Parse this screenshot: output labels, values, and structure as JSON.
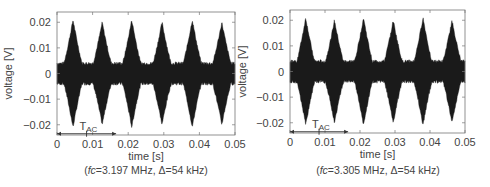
{
  "chart_data": [
    {
      "type": "line",
      "description": "Amplitude-modulated signal envelope (filled waveform)",
      "xlabel": "time [s]",
      "ylabel": "voltage [V]",
      "xlim": [
        0,
        0.05
      ],
      "ylim": [
        -0.024,
        0.024
      ],
      "xticks": [
        "0",
        "0.01",
        "0.02",
        "0.03",
        "0.04",
        "0.05"
      ],
      "yticks": [
        "0.02",
        "0.01",
        "0",
        "-0.01",
        "-0.02"
      ],
      "xtick_values": [
        0,
        0.01,
        0.02,
        0.03,
        0.04,
        0.05
      ],
      "ytick_values": [
        0.02,
        0.01,
        0,
        -0.01,
        -0.02
      ],
      "envelope": {
        "baseline_amplitude": 0.004,
        "peak_times": [
          0.0045,
          0.0127,
          0.021,
          0.0295,
          0.038,
          0.0463
        ],
        "peak_upper": [
          0.021,
          0.02,
          0.021,
          0.02,
          0.021,
          0.02
        ],
        "peak_lower": [
          -0.021,
          -0.02,
          -0.021,
          -0.02,
          -0.021,
          -0.02
        ]
      },
      "annotation": {
        "label": "T",
        "subscript": "AC",
        "arrow_from": 0,
        "arrow_mid": 0.0083,
        "arrow_to": 0.0166
      },
      "caption": {
        "prefix": "(",
        "italic": "fc",
        "rest": "=3.197 MHz, Δ=54 kHz)"
      },
      "grid": false
    },
    {
      "type": "line",
      "description": "Amplitude-modulated signal envelope (filled waveform)",
      "xlabel": "time [s]",
      "ylabel": "voltage [V]",
      "xlim": [
        0,
        0.05
      ],
      "ylim": [
        -0.024,
        0.024
      ],
      "xticks": [
        "0",
        "0.01",
        "0.02",
        "0.03",
        "0.04",
        "0.05"
      ],
      "yticks": [
        "0.02",
        "0.01",
        "0",
        "-0.01",
        "-0.02"
      ],
      "xtick_values": [
        0,
        0.01,
        0.02,
        0.03,
        0.04,
        0.05
      ],
      "ytick_values": [
        0.02,
        0.01,
        0,
        -0.01,
        -0.02
      ],
      "envelope": {
        "baseline_amplitude": 0.004,
        "peak_times": [
          0.0045,
          0.0127,
          0.021,
          0.0295,
          0.038,
          0.0463
        ],
        "peak_upper": [
          0.021,
          0.02,
          0.021,
          0.02,
          0.021,
          0.02
        ],
        "peak_lower": [
          -0.021,
          -0.02,
          -0.021,
          -0.02,
          -0.021,
          -0.02
        ]
      },
      "annotation": {
        "label": "T",
        "subscript": "AC",
        "arrow_from": 0,
        "arrow_mid": 0.0083,
        "arrow_to": 0.0166
      },
      "caption": {
        "prefix": "(",
        "italic": "fc",
        "rest": "=3.305 MHz, Δ=54 kHz)"
      },
      "grid": false
    }
  ]
}
